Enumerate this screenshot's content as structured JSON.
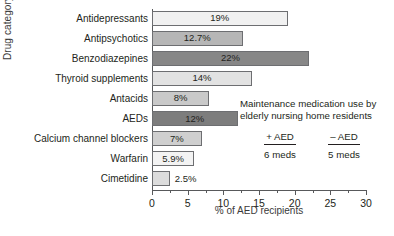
{
  "chart_data": {
    "type": "bar",
    "orientation": "horizontal",
    "title": "",
    "xlabel": "% of AED recipients",
    "ylabel": "Drug category",
    "xlim": [
      0,
      30
    ],
    "xticks": [
      0,
      5,
      10,
      15,
      20,
      25,
      30
    ],
    "xtick_labels": [
      "0",
      "5",
      "10",
      "15",
      "20",
      "25",
      "30"
    ],
    "minor_tick_step": 2.5,
    "grid": false,
    "legend_position": "none",
    "categories": [
      "Antidepressants",
      "Antipsychotics",
      "Benzodiazepines",
      "Thyroid supplements",
      "Antacids",
      "AEDs",
      "Calcium channel blockers",
      "Warfarin",
      "Cimetidine"
    ],
    "values": [
      19,
      12.7,
      22,
      14,
      8,
      12,
      7,
      5.9,
      2.5
    ],
    "value_labels": [
      "19%",
      "12.7%",
      "22%",
      "14%",
      "8%",
      "12%",
      "7%",
      "5.9%",
      "2.5%"
    ],
    "bar_colors": [
      "#f1f1f1",
      "#b6b6b6",
      "#878787",
      "#e2e2e2",
      "#c9c9c9",
      "#7d7d7d",
      "#cfcfcf",
      "#f3f3f3",
      "#dcdcdc"
    ],
    "bar_border_color": "#6d6e71",
    "label_placement": [
      "inside",
      "inside",
      "inside",
      "inside",
      "inside",
      "inside",
      "inside",
      "inside",
      "outside"
    ],
    "annotation": {
      "text": "Maintenance medication use by elderly nursing home residents",
      "columns": [
        {
          "header": "+ AED",
          "value": "6 meds"
        },
        {
          "header": "– AED",
          "value": "5 meds"
        }
      ]
    }
  }
}
